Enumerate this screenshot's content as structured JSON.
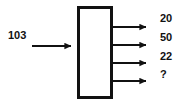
{
  "diagram": {
    "type": "block-diagram",
    "background_color": "#ffffff",
    "stroke_color": "#111111",
    "text_color": "#111111",
    "block": {
      "label": "",
      "x": 77,
      "y": 6,
      "width": 36,
      "height": 93,
      "border_width": 3,
      "fill": "#ffffff"
    },
    "input": {
      "label": "103",
      "arrow_y": 46,
      "line_start_x": 32,
      "arrow_tip_x": 77
    },
    "outputs": [
      {
        "label": "20",
        "arrow_y": 27
      },
      {
        "label": "50",
        "arrow_y": 45
      },
      {
        "label": "22",
        "arrow_y": 63
      },
      {
        "label": "?",
        "arrow_y": 81
      }
    ],
    "output_line_start_x": 113,
    "output_arrow_tip_x": 152,
    "output_label_x": 160
  }
}
